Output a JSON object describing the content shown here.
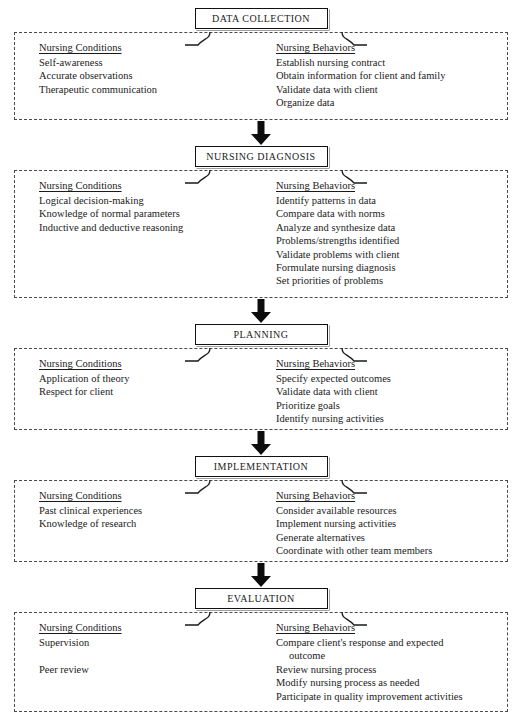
{
  "diagram": {
    "column_headings": {
      "conditions": "Nursing Conditions",
      "behaviors": "Nursing Behaviors"
    },
    "arrow_icon": "down-arrow-icon",
    "stages": [
      {
        "id": "data-collection",
        "header": "DATA COLLECTION",
        "conditions": [
          "Self-awareness",
          "Accurate observations",
          "Therapeutic communication"
        ],
        "behaviors": [
          "Establish nursing contract",
          "Obtain information for client and family",
          "Validate data with client",
          "Organize data"
        ]
      },
      {
        "id": "nursing-diagnosis",
        "header": "NURSING DIAGNOSIS",
        "conditions": [
          "Logical decision-making",
          "Knowledge of normal parameters",
          "Inductive and deductive reasoning"
        ],
        "behaviors": [
          "Identify patterns in data",
          "Compare data with norms",
          "Analyze and synthesize data",
          "Problems/strengths identified",
          "Validate problems with client",
          "Formulate nursing diagnosis",
          "Set priorities of problems"
        ]
      },
      {
        "id": "planning",
        "header": "PLANNING",
        "conditions": [
          "Application of theory",
          "Respect for client"
        ],
        "behaviors": [
          "Specify expected outcomes",
          "Validate data with client",
          "Prioritize goals",
          "Identify nursing activities"
        ]
      },
      {
        "id": "implementation",
        "header": "IMPLEMENTATION",
        "conditions": [
          "Past clinical experiences",
          "Knowledge of research"
        ],
        "behaviors": [
          "Consider available resources",
          "Implement nursing activities",
          "Generate alternatives",
          "Coordinate with other team members"
        ]
      },
      {
        "id": "evaluation",
        "header": "EVALUATION",
        "conditions": [
          "Supervision",
          "",
          "Peer review"
        ],
        "behaviors": [
          "Compare client's response and expected",
          "Review nursing process",
          "Modify nursing process as needed",
          "Participate in quality improvement activities"
        ],
        "behaviors_continuation": {
          "0": "outcome"
        }
      }
    ],
    "panel_heights": [
      88,
      128,
      82,
      82,
      100
    ],
    "colors": {
      "ink": "#1a1a1a",
      "dash": "#4a4a4a",
      "background": "#ffffff"
    }
  }
}
